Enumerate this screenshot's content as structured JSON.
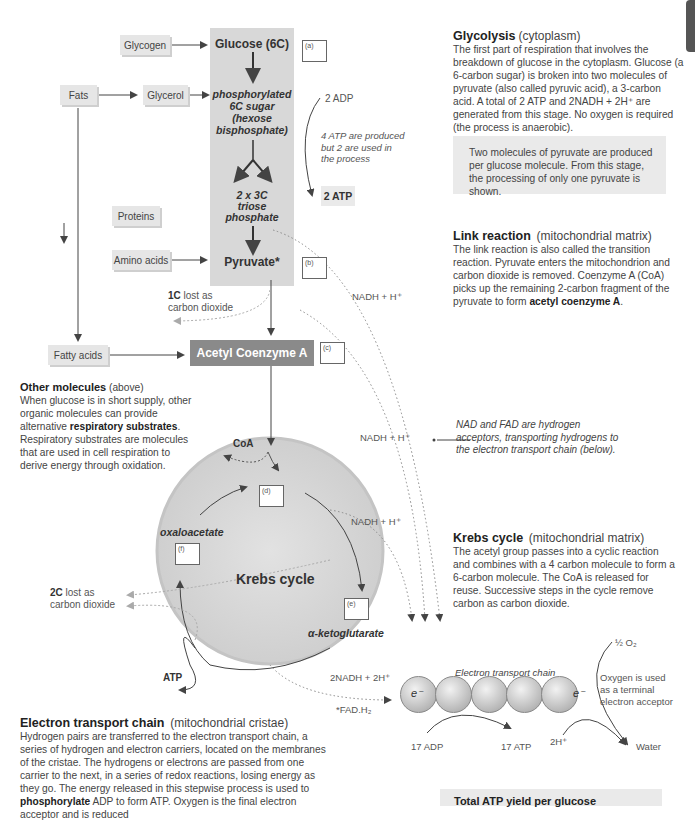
{
  "flow": {
    "glycogen": "Glycogen",
    "glucose": "Glucose (6C)",
    "fats": "Fats",
    "glycerol": "Glycerol",
    "hexose": [
      "phosphorylated",
      "6C sugar",
      "(hexose",
      "bisphosphate)"
    ],
    "triose": [
      "2 x 3C",
      "triose",
      "phosphate"
    ],
    "proteins": "Proteins",
    "amino_acids": "Amino acids",
    "pyruvate": "Pyruvate*",
    "fatty_acids": "Fatty acids",
    "acetyl_coa": "Acetyl Coenzyme A",
    "adp_in": "2 ADP",
    "atp_note": [
      "4 ATP are produced",
      "but 2 are used in",
      "the process"
    ],
    "atp_out": "2 ATP",
    "co2_1c_bold": "1C",
    "co2_1c_rest": " lost as",
    "co2_1c_line2": "carbon dioxide",
    "nadh_1": "NADH + H⁺",
    "nadh_2": "NADH + H⁺",
    "nadh_3": "NADH + H⁺",
    "coa": "CoA",
    "oxaloacetate": "oxaloacetate",
    "krebs": "Krebs cycle",
    "ketoglutarate": "α-ketoglutarate",
    "co2_2c_bold": "2C",
    "co2_2c_rest": " lost as",
    "co2_2c_line2": "carbon dioxide",
    "atp_krebs": "ATP",
    "nadh_2x": "2NADH + 2H⁺",
    "fadh": "*FAD.H₂",
    "etc_label": "Electron transport chain",
    "e_in": "e⁻",
    "e_out": "e⁻",
    "adp17": "17 ADP",
    "atp17": "17 ATP",
    "h2": "2H⁺",
    "o2": "½ O₂",
    "oxygen_note": [
      "Oxygen is used",
      "as a terminal",
      "electron acceptor"
    ],
    "water": "Water"
  },
  "answer_boxes": {
    "a": "(a)",
    "b": "(b)",
    "c": "(c)",
    "d": "(d)",
    "e": "(e)",
    "f": "(f)"
  },
  "glycolysis": {
    "title": "Glycolysis",
    "subtitle": "(cytoplasm)",
    "body": "The first part of respiration that involves the breakdown of glucose in the cytoplasm. Glucose (a 6-carbon sugar) is broken into two molecules of pyruvate (also called pyruvic acid), a 3-carbon acid. A total of 2 ATP and 2NADH + 2H⁺  are generated from this stage. No oxygen is required (the process is anaerobic).",
    "note": "Two molecules of pyruvate are produced per glucose molecule. From this stage, the processing of only one pyruvate is shown."
  },
  "link": {
    "title": "Link reaction",
    "subtitle": "(mitochondrial matrix)",
    "body": "The link reaction is also called the transition reaction. Pyruvate enters the mitochondrion and carbon dioxide is removed. Coenzyme A (CoA) picks up the remaining 2-carbon fragment of the pyruvate to form ",
    "bold": "acetyl coenzyme A",
    "end": "."
  },
  "other": {
    "title": "Other molecules",
    "subtitle": "(above)",
    "body1": "When glucose is in short supply, other organic molecules can provide alternative ",
    "bold": "respiratory substrates",
    "body2": ". Respiratory substrates are molecules that are used in cell respiration to derive energy through oxidation."
  },
  "nad_note": "NAD and FAD are hydrogen acceptors, transporting hydrogens to the electron transport chain (below).",
  "krebs_text": {
    "title": "Krebs cycle",
    "subtitle": "(mitochondrial matrix)",
    "body": "The acetyl group passes into a cyclic reaction and combines with a 4 carbon molecule to form a 6-carbon molecule. The CoA is released for reuse. Successive steps in the cycle remove carbon as carbon dioxide."
  },
  "etc_text": {
    "title": "Electron transport chain",
    "subtitle": "(mitochondrial cristae)",
    "body1": "Hydrogen pairs are transferred to the electron transport chain, a series of hydrogen and electron carriers, located on the membranes of the cristae. The hydrogens or electrons are passed from one carrier to the next, in a series of redox reactions, losing energy as they go. The energy released in this stepwise process is used to ",
    "bold": "phosphorylate",
    "body2": " ADP to form ATP. Oxygen is the final electron acceptor and is reduced"
  },
  "total": {
    "title": "Total ATP yield per glucose"
  }
}
